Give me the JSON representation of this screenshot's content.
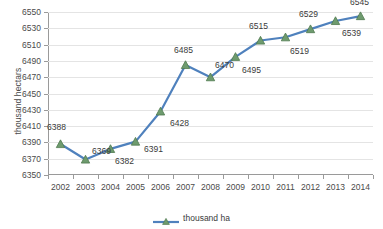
{
  "chart_data": {
    "type": "line",
    "title": "",
    "xlabel": "",
    "ylabel": "thousand hectars",
    "categories": [
      "2002",
      "2003",
      "2004",
      "2005",
      "2006",
      "2007",
      "2008",
      "2009",
      "2010",
      "2011",
      "2012",
      "2013",
      "2014"
    ],
    "values": [
      6388,
      6369,
      6382,
      6391,
      6428,
      6485,
      6470,
      6495,
      6515,
      6519,
      6529,
      6539,
      6545
    ],
    "series": [
      {
        "name": "thousand ha",
        "values": [
          6388,
          6369,
          6382,
          6391,
          6428,
          6485,
          6470,
          6495,
          6515,
          6519,
          6529,
          6539,
          6545
        ]
      }
    ],
    "data_labels": [
      "6388",
      "6369",
      "6382",
      "6391",
      "6428",
      "6485",
      "6470",
      "6495",
      "6515",
      "6519",
      "6529",
      "6539",
      "6545"
    ],
    "ylim": [
      6350,
      6550
    ],
    "ytick_step": 20,
    "yticks": [
      6350,
      6370,
      6390,
      6410,
      6430,
      6450,
      6470,
      6490,
      6510,
      6530,
      6550
    ],
    "ytick_labels": [
      "6350",
      "6370",
      "6390",
      "6410",
      "6430",
      "6450",
      "6470",
      "6490",
      "6510",
      "6530",
      "6550"
    ],
    "grid": true,
    "legend_position": "bottom",
    "line_color": "#4F81BD",
    "marker_color": "#6E9B6E",
    "marker_shape": "triangle",
    "grid_color": "#E4E4E4",
    "axis_color": "#9A9A9A"
  },
  "legend": {
    "entries": [
      {
        "label": "thousand ha"
      }
    ]
  }
}
